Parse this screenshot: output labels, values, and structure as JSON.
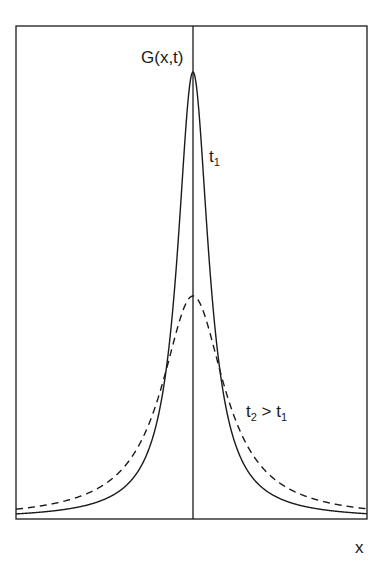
{
  "chart_data": {
    "type": "line",
    "title": "",
    "xlabel": "x",
    "ylabel": "G(x,t)",
    "grid": false,
    "legend": null,
    "axis_ticks": {
      "x": [],
      "y": []
    },
    "xlim": [
      -1,
      1
    ],
    "ylim": [
      0,
      1
    ],
    "annotations": [
      {
        "text": "G(x,t)",
        "target": "y-axis label at top of central axis"
      },
      {
        "text": "t",
        "sub": "1",
        "target": "solid curve"
      },
      {
        "text": "t",
        "sub": "2",
        "rest": " > t",
        "sub2": "1",
        "target": "dashed curve"
      },
      {
        "text": "x",
        "target": "x-axis label"
      }
    ],
    "series": [
      {
        "name": "t1",
        "style": "solid",
        "shape": "lorentzian",
        "peak_relative": 1.0,
        "half_width_relative": 0.107,
        "x": [
          -1.0,
          -0.75,
          -0.5,
          -0.25,
          -0.107,
          0.0,
          0.107,
          0.25,
          0.5,
          0.75,
          1.0
        ],
        "y": [
          0.011,
          0.02,
          0.044,
          0.155,
          0.5,
          1.0,
          0.5,
          0.155,
          0.044,
          0.02,
          0.011
        ]
      },
      {
        "name": "t2 > t1",
        "style": "dashed",
        "shape": "lorentzian",
        "peak_relative": 0.5,
        "half_width_relative": 0.215,
        "x": [
          -1.0,
          -0.75,
          -0.5,
          -0.25,
          -0.107,
          0.0,
          0.107,
          0.25,
          0.5,
          0.75,
          1.0
        ],
        "y": [
          0.022,
          0.038,
          0.078,
          0.213,
          0.401,
          0.5,
          0.401,
          0.213,
          0.078,
          0.038,
          0.022
        ]
      }
    ]
  },
  "labels": {
    "g_base": "G(x,t)",
    "t1_base": "t",
    "t1_sub": "1",
    "t2_base": "t",
    "t2_sub": "2",
    "t2_gt": " > t",
    "t2_gt_sub": "1",
    "x": "x"
  },
  "geometry": {
    "frame": {
      "left": 16,
      "top": 26,
      "right": 367,
      "bottom": 519
    },
    "center_x": 193,
    "peak1_px": 447,
    "gamma1_px": 19,
    "peak2_px": 223,
    "gamma2_px": 38
  },
  "colors": {
    "line": "#1a1a1a",
    "background": "#ffffff"
  }
}
